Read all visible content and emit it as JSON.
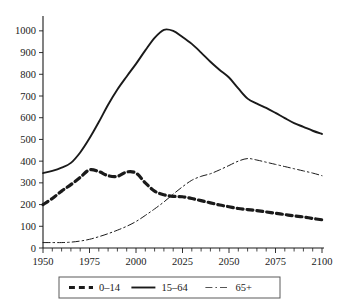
{
  "chart_data": {
    "type": "line",
    "title": "",
    "subtitle": "",
    "xlabel": "",
    "ylabel": "",
    "xlim": [
      1950,
      2100
    ],
    "ylim": [
      0,
      1050
    ],
    "grid": false,
    "legend_position": "bottom",
    "x_ticks": [
      1950,
      1975,
      2000,
      2025,
      2050,
      2075,
      2100
    ],
    "x_tick_labels": [
      "1950",
      "1975",
      "2000",
      "2025",
      "2050",
      "2075",
      "2100"
    ],
    "x_minor_tick_step": 5,
    "y_ticks": [
      0,
      100,
      200,
      300,
      400,
      500,
      600,
      700,
      800,
      900,
      1000
    ],
    "y_tick_labels": [
      "0",
      "100",
      "200",
      "300",
      "400",
      "500",
      "600",
      "700",
      "800",
      "900",
      "1000"
    ],
    "x": [
      1950,
      1955,
      1960,
      1965,
      1970,
      1975,
      1980,
      1985,
      1990,
      1995,
      2000,
      2005,
      2010,
      2015,
      2020,
      2025,
      2030,
      2035,
      2040,
      2045,
      2050,
      2055,
      2060,
      2065,
      2070,
      2075,
      2080,
      2085,
      2090,
      2095,
      2100
    ],
    "series": [
      {
        "name": "0-14",
        "label": "0–14",
        "style": "dashed",
        "width": 3.2,
        "color": "#1a1a1a",
        "values": [
          200,
          228,
          262,
          292,
          325,
          360,
          352,
          333,
          330,
          350,
          345,
          300,
          262,
          245,
          238,
          236,
          228,
          218,
          208,
          198,
          190,
          182,
          177,
          172,
          166,
          160,
          154,
          148,
          143,
          136,
          130
        ]
      },
      {
        "name": "15-64",
        "label": "15–64",
        "style": "solid",
        "width": 1.9,
        "color": "#1a1a1a",
        "values": [
          345,
          355,
          370,
          392,
          440,
          505,
          580,
          660,
          730,
          790,
          848,
          910,
          968,
          1005,
          1000,
          972,
          940,
          900,
          858,
          820,
          785,
          735,
          688,
          665,
          645,
          622,
          598,
          575,
          558,
          540,
          525
        ]
      },
      {
        "name": "65+",
        "label": "65+",
        "style": "dashdot",
        "width": 1.0,
        "color": "#555555",
        "values": [
          25,
          25,
          25,
          27,
          32,
          40,
          52,
          66,
          82,
          100,
          122,
          150,
          180,
          212,
          248,
          282,
          312,
          330,
          342,
          360,
          380,
          400,
          412,
          405,
          395,
          385,
          375,
          365,
          355,
          345,
          333
        ]
      }
    ]
  },
  "legend": {
    "items": [
      {
        "label": "0–14",
        "style": "dashed"
      },
      {
        "label": "15–64",
        "style": "solid"
      },
      {
        "label": "65+",
        "style": "dashdot"
      }
    ]
  }
}
